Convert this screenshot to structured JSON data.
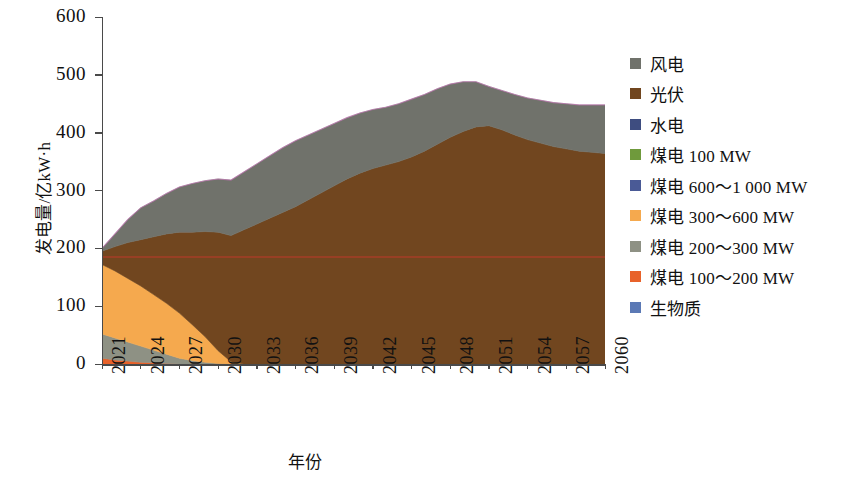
{
  "chart_data": {
    "type": "area",
    "title": "",
    "subtitle": "",
    "xlabel": "年份",
    "ylabel": "发电量/亿kW·h",
    "xlim": [
      2021,
      2060
    ],
    "ylim": [
      0,
      600
    ],
    "ytick_labels": [
      "600",
      "500",
      "400",
      "300",
      "200",
      "100",
      "0"
    ],
    "ytick_values": [
      600,
      500,
      400,
      300,
      200,
      100,
      0
    ],
    "xtick_labels": [
      "2021",
      "2024",
      "2027",
      "2030",
      "2033",
      "2036",
      "2039",
      "2042",
      "2045",
      "2048",
      "2051",
      "2054",
      "2057",
      "2060"
    ],
    "xtick_values": [
      2021,
      2024,
      2027,
      2030,
      2033,
      2036,
      2039,
      2042,
      2045,
      2048,
      2051,
      2054,
      2057,
      2060
    ],
    "grid": false,
    "stacked": true,
    "legend_position": "right",
    "annotations": [
      {
        "name": "reference-line",
        "type": "hline",
        "value": 185,
        "color": "#c0392b"
      }
    ],
    "x": [
      2021,
      2022,
      2023,
      2024,
      2025,
      2026,
      2027,
      2028,
      2029,
      2030,
      2031,
      2032,
      2033,
      2034,
      2035,
      2036,
      2037,
      2038,
      2039,
      2040,
      2041,
      2042,
      2043,
      2044,
      2045,
      2046,
      2047,
      2048,
      2049,
      2050,
      2051,
      2052,
      2053,
      2054,
      2055,
      2056,
      2057,
      2058,
      2059,
      2060
    ],
    "series": [
      {
        "name": "煤电 100~200 MW",
        "color": "#e8622a",
        "values": [
          10,
          7,
          5,
          3,
          2,
          1,
          0,
          0,
          0,
          0,
          0,
          0,
          0,
          0,
          0,
          0,
          0,
          0,
          0,
          0,
          0,
          0,
          0,
          0,
          0,
          0,
          0,
          0,
          0,
          0,
          0,
          0,
          0,
          0,
          0,
          0,
          0,
          0,
          0,
          0
        ]
      },
      {
        "name": "煤电 200~300 MW",
        "color": "#8e9184",
        "values": [
          42,
          38,
          33,
          28,
          22,
          16,
          10,
          6,
          3,
          1,
          0,
          0,
          0,
          0,
          0,
          0,
          0,
          0,
          0,
          0,
          0,
          0,
          0,
          0,
          0,
          0,
          0,
          0,
          0,
          0,
          0,
          0,
          0,
          0,
          0,
          0,
          0,
          0,
          0,
          0
        ]
      },
      {
        "name": "煤电 300~600 MW",
        "color": "#f5a94e",
        "values": [
          120,
          116,
          110,
          104,
          96,
          88,
          78,
          62,
          44,
          22,
          4,
          0,
          0,
          0,
          0,
          0,
          0,
          0,
          0,
          0,
          0,
          0,
          0,
          0,
          0,
          0,
          0,
          0,
          0,
          0,
          0,
          0,
          0,
          0,
          0,
          0,
          0,
          0,
          0,
          0
        ]
      },
      {
        "name": "煤电 600~1 000 MW",
        "color": "#4a5a96",
        "values": [
          0,
          0,
          0,
          0,
          0,
          0,
          0,
          0,
          0,
          0,
          0,
          0,
          0,
          0,
          0,
          0,
          0,
          0,
          0,
          0,
          0,
          0,
          0,
          0,
          0,
          0,
          0,
          0,
          0,
          0,
          0,
          0,
          0,
          0,
          0,
          0,
          0,
          0,
          0,
          0
        ]
      },
      {
        "name": "煤电 100 MW",
        "color": "#6f9a3c",
        "values": [
          0,
          0,
          0,
          0,
          0,
          0,
          0,
          0,
          0,
          0,
          0,
          0,
          0,
          0,
          0,
          0,
          0,
          0,
          0,
          0,
          0,
          0,
          0,
          0,
          0,
          0,
          0,
          0,
          0,
          0,
          0,
          0,
          0,
          0,
          0,
          0,
          0,
          0,
          0,
          0
        ]
      },
      {
        "name": "水电",
        "color": "#3e4d80",
        "values": [
          0,
          0,
          0,
          0,
          0,
          0,
          0,
          0,
          0,
          0,
          0,
          0,
          0,
          0,
          0,
          0,
          0,
          0,
          0,
          0,
          0,
          0,
          0,
          0,
          0,
          0,
          0,
          0,
          0,
          0,
          0,
          0,
          0,
          0,
          0,
          0,
          0,
          0,
          0,
          0
        ]
      },
      {
        "name": "生物质",
        "color": "#5b79b5",
        "values": [
          0,
          0,
          0,
          0,
          0,
          0,
          0,
          0,
          0,
          0,
          0,
          0,
          0,
          0,
          0,
          0,
          0,
          0,
          0,
          0,
          0,
          0,
          0,
          0,
          0,
          0,
          0,
          0,
          0,
          0,
          0,
          0,
          0,
          0,
          0,
          0,
          0,
          0,
          0,
          0
        ]
      },
      {
        "name": "光伏",
        "color": "#71461f",
        "values": [
          23,
          42,
          62,
          80,
          100,
          120,
          140,
          160,
          182,
          205,
          218,
          232,
          242,
          252,
          262,
          272,
          284,
          296,
          308,
          320,
          330,
          338,
          344,
          350,
          358,
          368,
          380,
          392,
          402,
          410,
          412,
          405,
          396,
          388,
          382,
          376,
          372,
          368,
          366,
          364
        ]
      },
      {
        "name": "风电",
        "color": "#70726b",
        "values": [
          5,
          22,
          40,
          55,
          62,
          70,
          78,
          84,
          88,
          92,
          96,
          100,
          104,
          108,
          112,
          114,
          112,
          110,
          108,
          106,
          104,
          102,
          100,
          100,
          100,
          98,
          96,
          92,
          86,
          78,
          68,
          68,
          70,
          72,
          74,
          76,
          78,
          80,
          82,
          84
        ]
      }
    ]
  },
  "legend": {
    "items": [
      {
        "label": "风电",
        "color": "#70726b"
      },
      {
        "label": "光伏",
        "color": "#71461f"
      },
      {
        "label": "水电",
        "color": "#3e4d80"
      },
      {
        "label": "煤电  100 MW",
        "color": "#6f9a3c"
      },
      {
        "label": "煤电  600～1 000 MW",
        "color": "#4a5a96"
      },
      {
        "label": "煤电  300～600 MW",
        "color": "#f5a94e"
      },
      {
        "label": "煤电  200～300 MW",
        "color": "#8e9184"
      },
      {
        "label": "煤电  100～200 MW",
        "color": "#e8622a"
      },
      {
        "label": "生物质",
        "color": "#5b79b5"
      }
    ]
  }
}
